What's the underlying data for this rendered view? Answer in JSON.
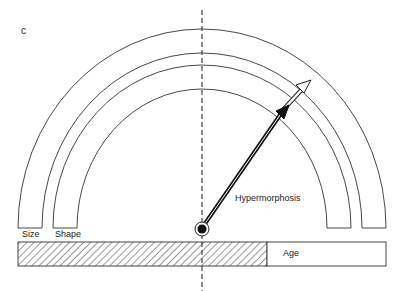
{
  "figure": {
    "panel_label": "c",
    "arrow_label": "Hypermorphosis",
    "band_labels": {
      "size": "Size",
      "shape": "Shape"
    },
    "bar_label": "Age"
  },
  "colors": {
    "line": "#333333",
    "fill": "#111111",
    "background": "#ffffff"
  }
}
